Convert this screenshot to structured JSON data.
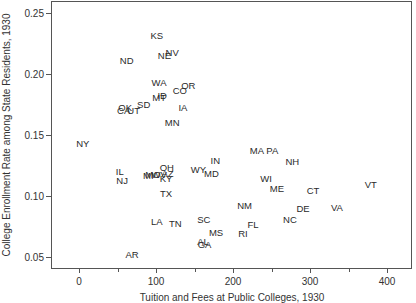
{
  "chart_data": {
    "type": "scatter",
    "title": "",
    "xlabel": "Tuition and Fees at Public Colleges, 1930",
    "ylabel": "College Enrollment Rate among State Residents, 1930",
    "xlim": [
      -35,
      435
    ],
    "ylim": [
      0.04,
      0.262
    ],
    "xticks": [
      0,
      100,
      200,
      300,
      400
    ],
    "xtick_minor": [
      50,
      150,
      250,
      350
    ],
    "yticks": [
      0.05,
      0.1,
      0.15,
      0.2,
      0.25
    ],
    "ytick_labels": [
      "0.05",
      "0.10",
      "0.15",
      "0.20",
      "0.25"
    ],
    "grid": false,
    "legend": null,
    "marker": "state-abbreviation text labels",
    "points": [
      {
        "label": "KS",
        "x": 101,
        "y": 0.231
      },
      {
        "label": "NV",
        "x": 121,
        "y": 0.217
      },
      {
        "label": "NE",
        "x": 111,
        "y": 0.215
      },
      {
        "label": "ND",
        "x": 62,
        "y": 0.211
      },
      {
        "label": "WA",
        "x": 104,
        "y": 0.193
      },
      {
        "label": "OR",
        "x": 142,
        "y": 0.19
      },
      {
        "label": "CO",
        "x": 131,
        "y": 0.186
      },
      {
        "label": "ID",
        "x": 108,
        "y": 0.182
      },
      {
        "label": "MT",
        "x": 104,
        "y": 0.18
      },
      {
        "label": "SD",
        "x": 84,
        "y": 0.175
      },
      {
        "label": "OK",
        "x": 60,
        "y": 0.172
      },
      {
        "label": "CA",
        "x": 58,
        "y": 0.17
      },
      {
        "label": "UT",
        "x": 71,
        "y": 0.17
      },
      {
        "label": "IA",
        "x": 135,
        "y": 0.172
      },
      {
        "label": "MN",
        "x": 121,
        "y": 0.16
      },
      {
        "label": "NY",
        "x": 5,
        "y": 0.143
      },
      {
        "label": "IL",
        "x": 53,
        "y": 0.12
      },
      {
        "label": "NJ",
        "x": 56,
        "y": 0.112
      },
      {
        "label": "IN",
        "x": 177,
        "y": 0.129
      },
      {
        "label": "WY",
        "x": 155,
        "y": 0.121
      },
      {
        "label": "MD",
        "x": 172,
        "y": 0.118
      },
      {
        "label": "OH",
        "x": 114,
        "y": 0.123
      },
      {
        "label": "AZ",
        "x": 115,
        "y": 0.118
      },
      {
        "label": "KY",
        "x": 113,
        "y": 0.114
      },
      {
        "label": "MI",
        "x": 90,
        "y": 0.116
      },
      {
        "label": "MO",
        "x": 96,
        "y": 0.117
      },
      {
        "label": "WV",
        "x": 104,
        "y": 0.117
      },
      {
        "label": "TX",
        "x": 113,
        "y": 0.102
      },
      {
        "label": "MA",
        "x": 231,
        "y": 0.137
      },
      {
        "label": "PA",
        "x": 251,
        "y": 0.137
      },
      {
        "label": "NH",
        "x": 277,
        "y": 0.128
      },
      {
        "label": "WI",
        "x": 243,
        "y": 0.114
      },
      {
        "label": "ME",
        "x": 257,
        "y": 0.106
      },
      {
        "label": "CT",
        "x": 304,
        "y": 0.104
      },
      {
        "label": "VT",
        "x": 379,
        "y": 0.109
      },
      {
        "label": "NM",
        "x": 215,
        "y": 0.092
      },
      {
        "label": "DE",
        "x": 291,
        "y": 0.089
      },
      {
        "label": "VA",
        "x": 335,
        "y": 0.09
      },
      {
        "label": "NC",
        "x": 274,
        "y": 0.08
      },
      {
        "label": "FL",
        "x": 226,
        "y": 0.076
      },
      {
        "label": "RI",
        "x": 213,
        "y": 0.069
      },
      {
        "label": "SC",
        "x": 162,
        "y": 0.08
      },
      {
        "label": "MS",
        "x": 178,
        "y": 0.07
      },
      {
        "label": "AL",
        "x": 161,
        "y": 0.062
      },
      {
        "label": "GA",
        "x": 163,
        "y": 0.06
      },
      {
        "label": "LA",
        "x": 101,
        "y": 0.079
      },
      {
        "label": "TN",
        "x": 125,
        "y": 0.077
      },
      {
        "label": "AR",
        "x": 69,
        "y": 0.052
      }
    ]
  }
}
